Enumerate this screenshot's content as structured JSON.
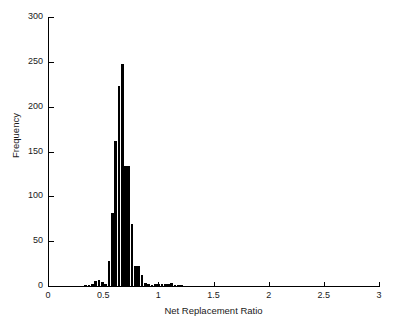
{
  "chart_data": {
    "type": "bar",
    "title": "",
    "xlabel": "Net Replacement Ratio",
    "ylabel": "Frequency",
    "xlim": [
      0,
      3
    ],
    "ylim": [
      0,
      300
    ],
    "xticks": [
      "0",
      "0.5",
      "1",
      "1.5",
      "2",
      "2.5",
      "3"
    ],
    "xtick_values": [
      0,
      0.5,
      1,
      1.5,
      2,
      2.5,
      3
    ],
    "yticks": [
      "0",
      "50",
      "100",
      "150",
      "200",
      "250",
      "300"
    ],
    "ytick_values": [
      0,
      50,
      100,
      150,
      200,
      250,
      300
    ],
    "grid": false,
    "legend": null,
    "bin_width": 0.03,
    "bar_color": "#000000",
    "categories": [
      0.345,
      0.375,
      0.405,
      0.435,
      0.465,
      0.495,
      0.525,
      0.555,
      0.585,
      0.615,
      0.645,
      0.675,
      0.705,
      0.735,
      0.765,
      0.795,
      0.825,
      0.855,
      0.885,
      0.915,
      0.945,
      0.975,
      1.005,
      1.035,
      1.065,
      1.095,
      1.125,
      1.155,
      1.185,
      1.215
    ],
    "values": [
      1,
      1,
      2,
      6,
      7,
      5,
      2,
      28,
      81,
      162,
      223,
      248,
      134,
      134,
      69,
      22,
      22,
      12,
      3,
      2,
      1,
      2,
      2,
      2,
      2,
      2,
      3,
      1,
      1,
      1
    ],
    "series": [
      {
        "name": "Net Replacement Ratio distribution",
        "values": [
          1,
          1,
          2,
          6,
          7,
          5,
          2,
          28,
          81,
          162,
          223,
          248,
          134,
          134,
          69,
          22,
          22,
          12,
          3,
          2,
          1,
          2,
          2,
          2,
          2,
          2,
          3,
          1,
          1,
          1
        ]
      }
    ]
  }
}
